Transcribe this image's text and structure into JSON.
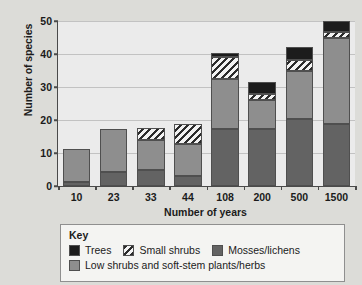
{
  "chart_data": {
    "type": "bar",
    "subtype": "stacked",
    "title": "",
    "xlabel": "Number of years",
    "ylabel": "Number of species",
    "categories": [
      "10",
      "23",
      "33",
      "44",
      "108",
      "200",
      "500",
      "1500"
    ],
    "ylim": [
      0,
      50
    ],
    "yticks": [
      0,
      10,
      20,
      30,
      40,
      50
    ],
    "grid": true,
    "legend_position": "below-plot",
    "legend_title": "Key",
    "series": [
      {
        "name": "Mosses/lichens",
        "color": "#636363",
        "values": [
          1.3,
          4.1,
          4.8,
          2.9,
          17.3,
          17.3,
          20.3,
          18.8
        ]
      },
      {
        "name": "Low shrubs and soft-stem plants/herbs",
        "color": "#8e8e8e",
        "values": [
          9.9,
          13.3,
          9.1,
          9.8,
          15.2,
          8.7,
          14.7,
          26.2
        ]
      },
      {
        "name": "Small shrubs",
        "color": "hatched",
        "values": [
          0,
          0,
          3.6,
          6.0,
          6.5,
          2.0,
          3.3,
          1.8
        ]
      },
      {
        "name": "Trees",
        "color": "#1c1c1c",
        "values": [
          0,
          0,
          0,
          0,
          1.3,
          3.5,
          3.7,
          3.2
        ]
      }
    ],
    "totals": [
      11.2,
      17.4,
      17.5,
      18.7,
      40.3,
      31.5,
      42.0,
      50.0
    ]
  },
  "legend": {
    "title": "Key",
    "items": [
      {
        "label": "Trees",
        "swatch": "solid-black"
      },
      {
        "label": "Small shrubs",
        "swatch": "hatched"
      },
      {
        "label": "Mosses/lichens",
        "swatch": "solid-dark-gray"
      },
      {
        "label": "Low shrubs and soft-stem plants/herbs",
        "swatch": "solid-mid-gray"
      }
    ]
  },
  "colors": {
    "trees": "#1c1c1c",
    "mosses": "#636363",
    "low_shrubs": "#8e8e8e",
    "plot_background": "#ebebeb",
    "page_background": "#dcdcd8",
    "axis": "#4a4a4a"
  }
}
